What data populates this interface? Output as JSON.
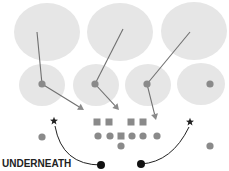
{
  "diagram": {
    "title": "UNDERNEATH",
    "colors": {
      "zone_fill": "#e6e6e6",
      "player": "#8a8a8a",
      "route_line": "#707070",
      "star": "#222222",
      "blitzer": "#111111",
      "background": "#ffffff"
    },
    "deep_zones": [
      {
        "cx": 47,
        "cy": 32,
        "rx": 33,
        "ry": 29
      },
      {
        "cx": 120,
        "cy": 32,
        "rx": 33,
        "ry": 29
      },
      {
        "cx": 194,
        "cy": 31,
        "rx": 33,
        "ry": 29
      }
    ],
    "underneath_zones": [
      {
        "cx": 42,
        "cy": 85,
        "rx": 23,
        "ry": 21
      },
      {
        "cx": 96,
        "cy": 85,
        "rx": 23,
        "ry": 21
      },
      {
        "cx": 148,
        "cy": 85,
        "rx": 23,
        "ry": 21
      },
      {
        "cx": 201,
        "cy": 84,
        "rx": 24,
        "ry": 21
      }
    ],
    "defenders": [
      {
        "x": 42,
        "y": 84
      },
      {
        "x": 95,
        "y": 84
      },
      {
        "x": 147,
        "y": 84
      },
      {
        "x": 210,
        "y": 84
      }
    ],
    "drop_lines": [
      {
        "x1": 37,
        "y1": 32,
        "x2": 42,
        "y2": 84
      },
      {
        "x1": 123,
        "y1": 29,
        "x2": 95,
        "y2": 84
      },
      {
        "x1": 190,
        "y1": 32,
        "x2": 147,
        "y2": 84
      }
    ],
    "rush_arrows": [
      {
        "x1": 42,
        "y1": 84,
        "x2": 84,
        "y2": 110
      },
      {
        "x1": 95,
        "y1": 84,
        "x2": 119,
        "y2": 110
      },
      {
        "x1": 147,
        "y1": 84,
        "x2": 156,
        "y2": 120
      }
    ],
    "line_squares": [
      {
        "x": 97,
        "y": 122
      },
      {
        "x": 109,
        "y": 122
      },
      {
        "x": 131,
        "y": 122
      },
      {
        "x": 143,
        "y": 122
      }
    ],
    "offense_circles": [
      {
        "x": 98,
        "y": 136
      },
      {
        "x": 110,
        "y": 136
      },
      {
        "x": 132,
        "y": 136
      },
      {
        "x": 143,
        "y": 136
      },
      {
        "x": 157,
        "y": 136
      },
      {
        "x": 121,
        "y": 146
      },
      {
        "x": 42,
        "y": 137
      },
      {
        "x": 210,
        "y": 146
      }
    ],
    "center_square": {
      "x": 121,
      "y": 136
    },
    "stars": [
      {
        "x": 54,
        "y": 121
      },
      {
        "x": 190,
        "y": 122
      }
    ],
    "blitz_paths": [
      {
        "from": {
          "x": 55,
          "y": 126
        },
        "ctrl": {
          "x": 62,
          "y": 165
        },
        "to": {
          "x": 101,
          "y": 165
        }
      },
      {
        "from": {
          "x": 189,
          "y": 127
        },
        "ctrl": {
          "x": 172,
          "y": 162
        },
        "to": {
          "x": 141,
          "y": 164
        }
      }
    ],
    "blitzers": [
      {
        "x": 101,
        "y": 165
      },
      {
        "x": 141,
        "y": 164
      }
    ]
  }
}
